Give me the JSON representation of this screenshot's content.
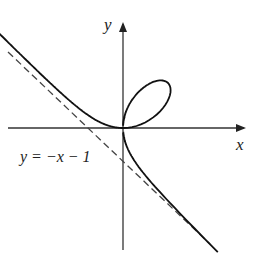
{
  "diagram": {
    "curve_equation": "x^3 + y^3 = 3xy",
    "axes": {
      "x_label": "x",
      "y_label": "y"
    },
    "asymptote": {
      "label": "y = −x − 1",
      "style": "dashed"
    },
    "colors": {
      "curve": "#111111",
      "axis": "#333333",
      "asymptote": "#444444"
    }
  }
}
